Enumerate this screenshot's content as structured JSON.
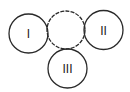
{
  "diagram": {
    "stroke_color": "#2a2a2a",
    "background": "#ffffff",
    "circles": [
      {
        "id": "I",
        "label": "I",
        "cx": 28.5,
        "cy": 33.5,
        "r": 19.5,
        "style": "solid"
      },
      {
        "id": "mid",
        "label": "",
        "cx": 66,
        "cy": 30,
        "r": 19,
        "style": "dashed"
      },
      {
        "id": "II",
        "label": "II",
        "cx": 103.5,
        "cy": 30,
        "r": 19.5,
        "style": "solid"
      },
      {
        "id": "III",
        "label": "III",
        "cx": 67.5,
        "cy": 68.5,
        "r": 19.5,
        "style": "solid"
      }
    ]
  }
}
